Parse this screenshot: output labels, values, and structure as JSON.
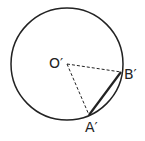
{
  "diagram": {
    "type": "circle-geometry",
    "labels": {
      "center": "O′",
      "point_b": "B′",
      "point_a": "A′"
    },
    "elements": {
      "circle": {
        "cx": 67,
        "cy": 64,
        "r": 56
      },
      "center": {
        "x": 67,
        "y": 64
      },
      "point_a": {
        "x": 89,
        "y": 115
      },
      "point_b": {
        "x": 121,
        "y": 72
      },
      "radius_to_a": "dashed",
      "radius_to_b": "dashed",
      "chord_ab": "solid-thick"
    },
    "colors": {
      "stroke": "#222222",
      "background": "#ffffff"
    }
  }
}
